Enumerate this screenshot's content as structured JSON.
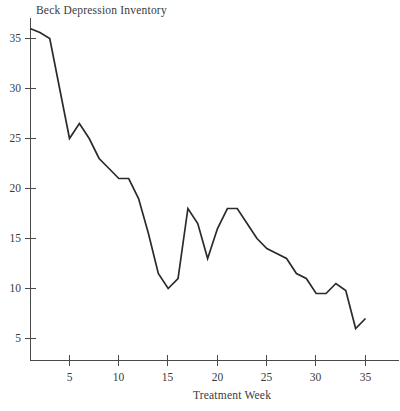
{
  "chart_data": {
    "type": "line",
    "title": "Beck Depression Inventory",
    "xlabel": "Treatment Week",
    "ylabel": "",
    "xlim": [
      1,
      36
    ],
    "ylim": [
      0,
      37
    ],
    "grid": false,
    "legend": null,
    "x_ticks": [
      5,
      10,
      15,
      20,
      25,
      30,
      35
    ],
    "y_ticks": [
      5,
      10,
      15,
      20,
      25,
      30,
      35
    ],
    "x_tick_labels": [
      "5",
      "10",
      "15",
      "20",
      "25",
      "30",
      "35"
    ],
    "y_tick_labels": [
      "5",
      "10",
      "15",
      "20",
      "25",
      "30",
      "35"
    ],
    "series": [
      {
        "name": "Beck Depression Inventory",
        "color": "#2b2b2b",
        "x": [
          1,
          2,
          3,
          4,
          5,
          6,
          7,
          8,
          9,
          10,
          11,
          12,
          13,
          14,
          15,
          16,
          17,
          18,
          19,
          20,
          21,
          22,
          23,
          24,
          25,
          26,
          27,
          28,
          29,
          30,
          31,
          32,
          33,
          34,
          35
        ],
        "values": [
          36,
          35.6,
          35,
          30,
          25,
          26.5,
          25,
          23,
          22,
          21,
          21,
          19,
          15.5,
          11.5,
          10,
          11,
          18,
          16.5,
          13,
          16,
          18,
          18,
          16.5,
          15,
          14,
          13.5,
          13,
          11.5,
          11,
          9.5,
          9.5,
          10.5,
          9.8,
          6,
          7
        ]
      }
    ]
  },
  "axes": {
    "y_axis_name": "value-axis",
    "x_axis_name": "week-axis"
  }
}
